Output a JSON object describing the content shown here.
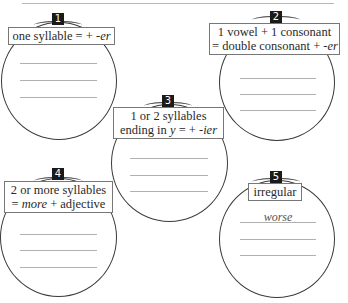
{
  "worksheet": {
    "groups": [
      {
        "number": "1",
        "rule_line1": "one syllable = + ",
        "rule_suffix": "-er",
        "answers": [
          "",
          "",
          ""
        ]
      },
      {
        "number": "2",
        "rule_line1": "1 vowel + 1 consonant",
        "rule_line2": "= double consonant + ",
        "rule_suffix": "-er",
        "answers": [
          "",
          "",
          ""
        ]
      },
      {
        "number": "3",
        "rule_line1": "1 or 2 syllables",
        "rule_line2_pre": "ending in ",
        "rule_line2_y": "y",
        "rule_line2_mid": " = + ",
        "rule_suffix": "-ier",
        "answers": [
          "",
          "",
          ""
        ]
      },
      {
        "number": "4",
        "rule_line1": "2 or more syllables",
        "rule_line2_pre": "= ",
        "rule_line2_more": "more",
        "rule_line2_post": " + adjective",
        "answers": [
          "",
          "",
          ""
        ]
      },
      {
        "number": "5",
        "rule_line1": "irregular",
        "answers": [
          "worse",
          "",
          ""
        ]
      }
    ]
  }
}
